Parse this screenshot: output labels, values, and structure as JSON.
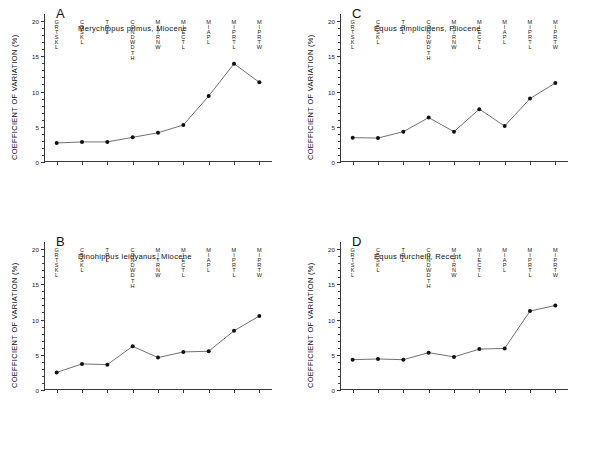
{
  "figure": {
    "y_axis_title": "COEFFICIENT OF VARIATION (%)",
    "y_ticks": [
      "0",
      "5",
      "10",
      "15",
      "20"
    ],
    "categories": [
      "GRTSKL",
      "CBSKL",
      "TRL",
      "CONDWDTH",
      "MITRNW",
      "MIECTL",
      "MIAPL",
      "MIPRTL",
      "MIPRTW"
    ]
  },
  "panels": [
    {
      "letter": "A",
      "title": "Merychippus primus, Miocene",
      "values": [
        2.7,
        2.85,
        2.85,
        3.5,
        4.15,
        5.25,
        9.35,
        13.95,
        11.3
      ]
    },
    {
      "letter": "B",
      "title": "Dinohippus leidyanus, Miocene",
      "values": [
        2.5,
        3.7,
        3.6,
        6.2,
        4.6,
        5.4,
        5.5,
        8.4,
        10.5
      ]
    },
    {
      "letter": "C",
      "title": "Equus simplicidens, Pliocene",
      "values": [
        3.45,
        3.4,
        4.3,
        6.3,
        4.3,
        7.5,
        5.1,
        9.0,
        11.2
      ]
    },
    {
      "letter": "D",
      "title": "Equus burchelli, Recent",
      "values": [
        4.3,
        4.4,
        4.3,
        5.3,
        4.7,
        5.8,
        5.9,
        11.2,
        12.0
      ]
    }
  ],
  "chart_data": [
    {
      "type": "line",
      "title": "Merychippus primus, Miocene",
      "panel": "A",
      "xlabel": "",
      "ylabel": "COEFFICIENT OF VARIATION (%)",
      "ylim": [
        0,
        21
      ],
      "yticks": [
        0,
        5,
        10,
        15,
        20
      ],
      "grid": false,
      "legend": "none",
      "categories": [
        "GRTSKL",
        "CBSKL",
        "TRL",
        "CONDWDTH",
        "MITRNW",
        "MIECTL",
        "MIAPL",
        "MIPRTL",
        "MIPRTW"
      ],
      "values": [
        2.7,
        2.85,
        2.85,
        3.5,
        4.15,
        5.25,
        9.35,
        13.95,
        11.3
      ]
    },
    {
      "type": "line",
      "title": "Dinohippus leidyanus, Miocene",
      "panel": "B",
      "xlabel": "",
      "ylabel": "COEFFICIENT OF VARIATION (%)",
      "ylim": [
        0,
        21
      ],
      "yticks": [
        0,
        5,
        10,
        15,
        20
      ],
      "grid": false,
      "legend": "none",
      "categories": [
        "GRTSKL",
        "CBSKL",
        "TRL",
        "CONDWDTH",
        "MITRNW",
        "MIECTL",
        "MIAPL",
        "MIPRTL",
        "MIPRTW"
      ],
      "values": [
        2.5,
        3.7,
        3.6,
        6.2,
        4.6,
        5.4,
        5.5,
        8.4,
        10.5
      ]
    },
    {
      "type": "line",
      "title": "Equus simplicidens, Pliocene",
      "panel": "C",
      "xlabel": "",
      "ylabel": "COEFFICIENT OF VARIATION (%)",
      "ylim": [
        0,
        21
      ],
      "yticks": [
        0,
        5,
        10,
        15,
        20
      ],
      "grid": false,
      "legend": "none",
      "categories": [
        "GRTSKL",
        "CBSKL",
        "TRL",
        "CONDWDTH",
        "MITRNW",
        "MIECTL",
        "MIAPL",
        "MIPRTL",
        "MIPRTW"
      ],
      "values": [
        3.45,
        3.4,
        4.3,
        6.3,
        4.3,
        7.5,
        5.1,
        9.0,
        11.2
      ]
    },
    {
      "type": "line",
      "title": "Equus burchelli, Recent",
      "panel": "D",
      "xlabel": "",
      "ylabel": "COEFFICIENT OF VARIATION (%)",
      "ylim": [
        0,
        21
      ],
      "yticks": [
        0,
        5,
        10,
        15,
        20
      ],
      "grid": false,
      "legend": "none",
      "categories": [
        "GRTSKL",
        "CBSKL",
        "TRL",
        "CONDWDTH",
        "MITRNW",
        "MIECTL",
        "MIAPL",
        "MIPRTL",
        "MIPRTW"
      ],
      "values": [
        4.3,
        4.4,
        4.3,
        5.3,
        4.7,
        5.8,
        5.9,
        11.2,
        12.0
      ]
    }
  ]
}
